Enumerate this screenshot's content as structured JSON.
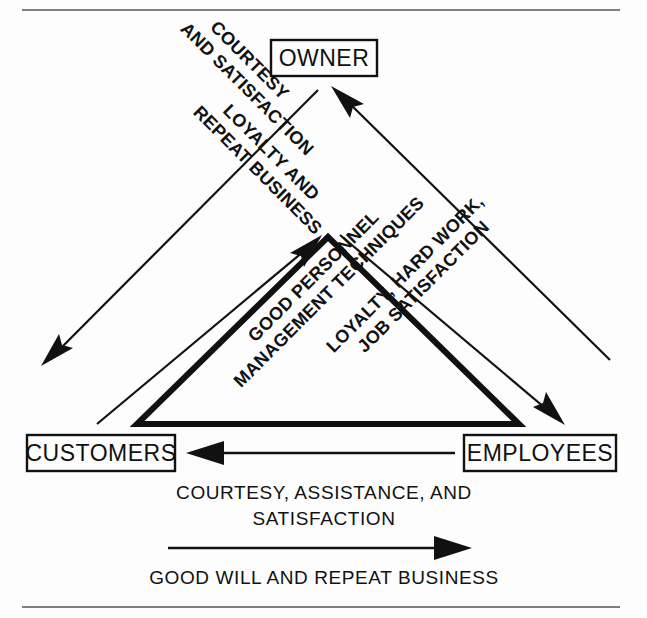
{
  "diagram": {
    "colors": {
      "ink": "#111111",
      "background": "#fdfdfd",
      "rule": "#555555"
    },
    "rules": {
      "top_rule": "horizontal-rule",
      "bottom_rule": "horizontal-rule"
    },
    "nodes": [
      {
        "id": "owner",
        "label": "OWNER"
      },
      {
        "id": "customers",
        "label": "CUSTOMERS"
      },
      {
        "id": "employees",
        "label": "EMPLOYEES"
      }
    ],
    "edge_labels": [
      {
        "id": "owner-to-customers",
        "from": "OWNER",
        "to": "CUSTOMERS",
        "lines": [
          "COURTESY",
          "AND SATISFACTION"
        ]
      },
      {
        "id": "customers-to-owner",
        "from": "CUSTOMERS",
        "to": "OWNER",
        "lines": [
          "LOYALTY AND",
          "REPEAT BUSINESS"
        ]
      },
      {
        "id": "employees-to-owner",
        "from": "EMPLOYEES",
        "to": "OWNER",
        "lines": [
          "LOYALTY, HARD WORK,",
          "JOB SATISFACTION"
        ]
      },
      {
        "id": "owner-to-employees",
        "from": "OWNER",
        "to": "EMPLOYEES",
        "lines": [
          "GOOD PERSONNEL",
          "MANAGEMENT TECHNIQUES"
        ]
      }
    ],
    "bottom_flows": [
      {
        "id": "employees-to-customers",
        "direction": "left",
        "lines": [
          "COURTESY, ASSISTANCE, AND",
          "SATISFACTION"
        ]
      },
      {
        "id": "customers-to-employees",
        "direction": "right",
        "lines": [
          "GOOD WILL AND REPEAT BUSINESS"
        ]
      }
    ]
  }
}
